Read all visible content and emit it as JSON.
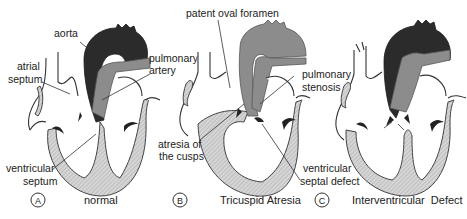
{
  "colors": {
    "aorta": "#2b2b2b",
    "pulmonary_artery": "#8c8c8c",
    "myocardium_hatch": "#cfcfcf",
    "background": "#ffffff"
  },
  "panels": [
    {
      "letter": "A",
      "caption": "normal",
      "labels": {
        "aorta": "aorta",
        "atrial_septum_1": "atrial",
        "atrial_septum_2": "septum",
        "pulmonary_artery_1": "pulmonary",
        "pulmonary_artery_2": "artery",
        "ventricular_septum_1": "ventricular",
        "ventricular_septum_2": "septum"
      }
    },
    {
      "letter": "B",
      "caption": "Tricuspid Atresia",
      "labels": {
        "patent_oval_foramen": "patent oval foramen",
        "pulmonary_stenosis_1": "pulmonary",
        "pulmonary_stenosis_2": "stenosis",
        "atresia_1": "atresia of",
        "atresia_2": "the cusps",
        "vsd_1": "ventricular",
        "vsd_2": "septal defect"
      }
    },
    {
      "letter": "C",
      "caption": "Interventricular  Defect",
      "labels": {}
    }
  ]
}
